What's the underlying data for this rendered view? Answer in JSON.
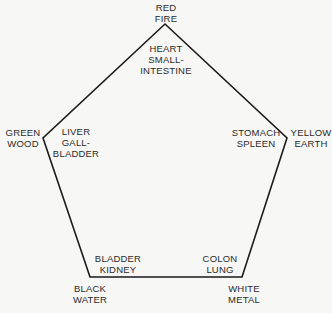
{
  "diagram": {
    "type": "five-element-pentagon",
    "stroke_color": "#1a1a1a",
    "background": "#f7f7f5",
    "vertices": [
      {
        "id": "fire",
        "x": 165,
        "y": 24
      },
      {
        "id": "earth",
        "x": 287,
        "y": 138
      },
      {
        "id": "metal",
        "x": 242,
        "y": 277
      },
      {
        "id": "water",
        "x": 90,
        "y": 277
      },
      {
        "id": "wood",
        "x": 43,
        "y": 138
      }
    ],
    "elements": [
      {
        "id": "fire",
        "color": "RED",
        "element": "FIRE",
        "organs": [
          "HEART",
          "SMALL-",
          "INTESTINE"
        ]
      },
      {
        "id": "earth",
        "color": "YELLOW",
        "element": "EARTH",
        "organs": [
          "STOMACH",
          "SPLEEN"
        ]
      },
      {
        "id": "metal",
        "color": "WHITE",
        "element": "METAL",
        "organs": [
          "COLON",
          "LUNG"
        ]
      },
      {
        "id": "water",
        "color": "BLACK",
        "element": "WATER",
        "organs": [
          "BLADDER",
          "KIDNEY"
        ]
      },
      {
        "id": "wood",
        "color": "GREEN",
        "element": "WOOD",
        "organs": [
          "LIVER",
          "GALL-",
          "BLADDER"
        ]
      }
    ]
  }
}
